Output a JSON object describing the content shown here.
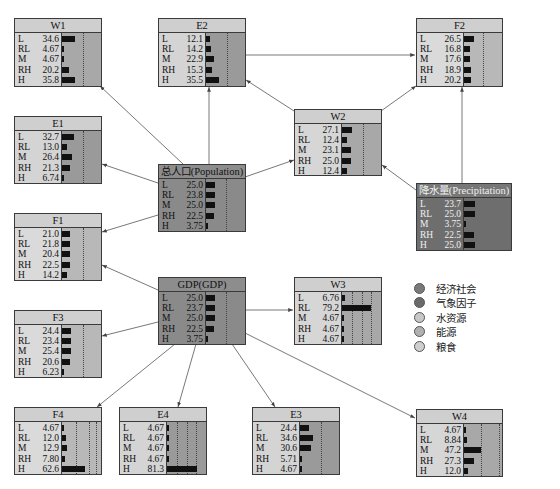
{
  "diagram": {
    "type": "bayesian-network",
    "state_labels": [
      "L",
      "RL",
      "M",
      "RH",
      "H"
    ],
    "nodes": {
      "W1": {
        "title": "W1",
        "category": "water",
        "values": [
          "34.6",
          "4.67",
          "4.67",
          "20.2",
          "35.8"
        ]
      },
      "E2": {
        "title": "E2",
        "category": "energy",
        "values": [
          "12.1",
          "14.2",
          "22.9",
          "15.3",
          "35.5"
        ]
      },
      "F2": {
        "title": "F2",
        "category": "food",
        "values": [
          "26.5",
          "16.8",
          "17.6",
          "18.9",
          "20.2"
        ]
      },
      "E1": {
        "title": "E1",
        "category": "energy",
        "values": [
          "32.7",
          "13.0",
          "26.4",
          "21.3",
          "6.74"
        ]
      },
      "W2": {
        "title": "W2",
        "category": "water",
        "values": [
          "27.1",
          "12.4",
          "23.1",
          "25.0",
          "12.4"
        ]
      },
      "Population": {
        "title": "总人口(Population)",
        "category": "socio-economic",
        "values": [
          "25.0",
          "23.8",
          "25.0",
          "22.5",
          "3.75"
        ]
      },
      "Precipitation": {
        "title": "降水量(Precipitation)",
        "category": "climate",
        "values": [
          "23.7",
          "25.0",
          "3.75",
          "22.5",
          "25.0"
        ]
      },
      "F1": {
        "title": "F1",
        "category": "food",
        "values": [
          "21.0",
          "21.8",
          "20.4",
          "22.5",
          "14.2"
        ]
      },
      "GDP": {
        "title": "GDP(GDP)",
        "category": "socio-economic",
        "values": [
          "25.0",
          "23.7",
          "25.0",
          "22.5",
          "3.75"
        ]
      },
      "W3": {
        "title": "W3",
        "category": "water",
        "values": [
          "6.76",
          "79.2",
          "4.67",
          "4.67",
          "4.67"
        ]
      },
      "F3": {
        "title": "F3",
        "category": "food",
        "values": [
          "24.4",
          "23.4",
          "25.4",
          "20.6",
          "6.23"
        ]
      },
      "F4": {
        "title": "F4",
        "category": "food",
        "values": [
          "4.67",
          "12.0",
          "12.9",
          "7.80",
          "62.6"
        ]
      },
      "E4": {
        "title": "E4",
        "category": "energy",
        "values": [
          "4.67",
          "4.67",
          "4.67",
          "4.67",
          "81.3"
        ]
      },
      "E3": {
        "title": "E3",
        "category": "energy",
        "values": [
          "24.4",
          "34.6",
          "30.6",
          "5.71",
          "4.67"
        ]
      },
      "W4": {
        "title": "W4",
        "category": "water",
        "values": [
          "4.67",
          "8.84",
          "47.2",
          "27.3",
          "12.0"
        ]
      }
    },
    "edges": [
      [
        "Population",
        "W1"
      ],
      [
        "Population",
        "E2"
      ],
      [
        "Population",
        "E1"
      ],
      [
        "Population",
        "F1"
      ],
      [
        "Population",
        "W2"
      ],
      [
        "E2",
        "F2"
      ],
      [
        "W2",
        "E2"
      ],
      [
        "W2",
        "F2"
      ],
      [
        "Precipitation",
        "W2"
      ],
      [
        "Precipitation",
        "F2"
      ],
      [
        "GDP",
        "F1"
      ],
      [
        "GDP",
        "F3"
      ],
      [
        "GDP",
        "W3"
      ],
      [
        "GDP",
        "F4"
      ],
      [
        "GDP",
        "E4"
      ],
      [
        "GDP",
        "E3"
      ],
      [
        "GDP",
        "W4"
      ]
    ]
  },
  "legend": {
    "items": [
      {
        "label": "经济社会",
        "color": "#7a7a7a"
      },
      {
        "label": "气象因子",
        "color": "#6a6a6a"
      },
      {
        "label": "水资源",
        "color": "#c8c8c8"
      },
      {
        "label": "能源",
        "color": "#b0b0b0"
      },
      {
        "label": "粮食",
        "color": "#cfcfcf"
      }
    ]
  }
}
